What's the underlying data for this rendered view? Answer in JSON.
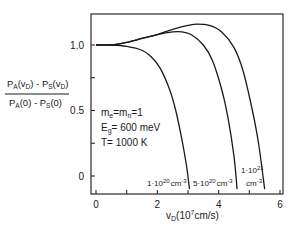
{
  "chart_data": {
    "type": "line",
    "title": "",
    "xlabel": "v_D (10^7 cm/s)",
    "ylabel": "[P_A(v_D) - P_S(v_D)] / [P_A(0) - P_S(0)]",
    "xlim": [
      -0.15,
      6.1
    ],
    "ylim": [
      -0.13,
      1.25
    ],
    "x_ticks": [
      0,
      2,
      4,
      6
    ],
    "x_minor_ticks": [
      1,
      3,
      5
    ],
    "y_ticks": [
      0,
      0.5,
      1.0
    ],
    "y_tick_labels": [
      "0",
      "0.5",
      "1.0"
    ],
    "y_minor_ticks": [
      0.25,
      0.75
    ],
    "grid": false,
    "legend": null,
    "annotations": {
      "params": [
        "m_e = m_n = 1",
        "E_g = 600 meV",
        "T = 1000 K"
      ]
    },
    "series": [
      {
        "name": "1·10^20 cm^-3",
        "x": [
          0,
          0.5,
          1.0,
          1.5,
          1.8,
          2.1,
          2.4,
          2.6,
          2.8,
          2.95,
          3.05
        ],
        "y": [
          1.0,
          1.0,
          0.99,
          0.96,
          0.91,
          0.82,
          0.66,
          0.5,
          0.28,
          0.08,
          -0.1
        ]
      },
      {
        "name": "5·10^20 cm^-3",
        "x": [
          0,
          0.5,
          1.0,
          1.5,
          2.0,
          2.5,
          2.8,
          3.1,
          3.5,
          3.8,
          4.1,
          4.3,
          4.5,
          4.6
        ],
        "y": [
          1.0,
          1.0,
          1.02,
          1.05,
          1.08,
          1.1,
          1.1,
          1.08,
          1.0,
          0.88,
          0.66,
          0.45,
          0.15,
          -0.1
        ]
      },
      {
        "name": "1·10^21 cm^-3",
        "x": [
          0,
          0.5,
          1.0,
          1.5,
          2.0,
          2.5,
          3.0,
          3.3,
          3.7,
          4.1,
          4.5,
          4.8,
          5.1,
          5.3,
          5.5
        ],
        "y": [
          1.0,
          1.0,
          1.02,
          1.05,
          1.08,
          1.12,
          1.15,
          1.16,
          1.15,
          1.1,
          0.98,
          0.8,
          0.5,
          0.25,
          -0.1
        ]
      }
    ],
    "series_labels": [
      {
        "text": "1·10",
        "sup": "20",
        "unit": "cm",
        "unit_sup": "-3"
      },
      {
        "text": "5·10",
        "sup": "20",
        "unit": "cm",
        "unit_sup": "-3"
      },
      {
        "text": "1·10",
        "sup": "21",
        "unit": "cm",
        "unit_sup": "-3"
      }
    ]
  },
  "labels": {
    "ylabel_num_a": "P",
    "ylabel_num_a_sub": "A",
    "ylabel_num_b": "(v",
    "ylabel_num_b_sub": "D",
    "ylabel_num_c": ") - P",
    "ylabel_num_c_sub": "S",
    "ylabel_num_d": "(v",
    "ylabel_num_d_sub": "D",
    "ylabel_num_e": ")",
    "ylabel_den_a": "P",
    "ylabel_den_a_sub": "A",
    "ylabel_den_b": "(0) - P",
    "ylabel_den_b_sub": "S",
    "ylabel_den_c": "(0)",
    "xlabel_v": "v",
    "xlabel_sub": "D",
    "xlabel_rest_a": "(10",
    "xlabel_sup": "7",
    "xlabel_rest_b": "cm/s)",
    "param1_a": "m",
    "param1_a_sub": "e",
    "param1_b": "=m",
    "param1_b_sub": "n",
    "param1_c": "=1",
    "param2_a": "E",
    "param2_a_sub": "g",
    "param2_b": "= 600 meV",
    "param3": "T= 1000 K",
    "third_label_line1": "1·10",
    "third_label_line1_sup": "21",
    "third_label_line2": "cm",
    "third_label_line2_sup": "-3"
  }
}
